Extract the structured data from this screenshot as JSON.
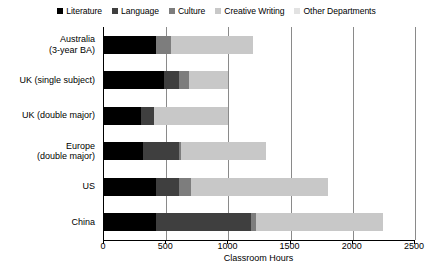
{
  "chart_data": {
    "type": "bar",
    "orientation": "horizontal",
    "stacked": true,
    "title": "",
    "xlabel": "Classroom Hours",
    "ylabel": "",
    "xlim": [
      0,
      2500
    ],
    "xticks": [
      0,
      500,
      1000,
      1500,
      2000,
      2500
    ],
    "xtick_labels": [
      "0",
      "500",
      "1000",
      "1500",
      "2000",
      "2500"
    ],
    "grid": "vertical",
    "legend_position": "top-center",
    "categories": [
      "Australia\n(3-year BA)",
      "UK (single subject)",
      "UK (double major)",
      "Europe\n(double major)",
      "US",
      "China"
    ],
    "series": [
      {
        "name": "Literature",
        "color": "#000000",
        "values": [
          420,
          480,
          300,
          310,
          420,
          420
        ]
      },
      {
        "name": "Language",
        "color": "#3f3f3f",
        "values": [
          0,
          120,
          100,
          290,
          180,
          760
        ]
      },
      {
        "name": "Culture",
        "color": "#7d7d7d",
        "values": [
          120,
          80,
          0,
          20,
          100,
          40
        ]
      },
      {
        "name": "Creative Writing",
        "color": "#c8c8c8",
        "values": [
          660,
          320,
          600,
          680,
          1100,
          1020
        ]
      },
      {
        "name": "Other Departments",
        "color": "#e2e2e2",
        "values": [
          0,
          0,
          0,
          0,
          0,
          0
        ]
      }
    ],
    "totals": [
      1200,
      1000,
      1000,
      1300,
      1800,
      2240
    ]
  },
  "legend": {
    "items": [
      {
        "label": "Literature",
        "color": "#000000"
      },
      {
        "label": "Language",
        "color": "#3f3f3f"
      },
      {
        "label": "Culture",
        "color": "#7d7d7d"
      },
      {
        "label": "Creative Writing",
        "color": "#c8c8c8"
      },
      {
        "label": "Other Departments",
        "color": "#e2e2e2"
      }
    ]
  },
  "axis": {
    "x_title": "Classroom Hours"
  },
  "colors": {
    "background": "#ffffff",
    "axis": "#000000",
    "grid": "#8a8a8a"
  }
}
